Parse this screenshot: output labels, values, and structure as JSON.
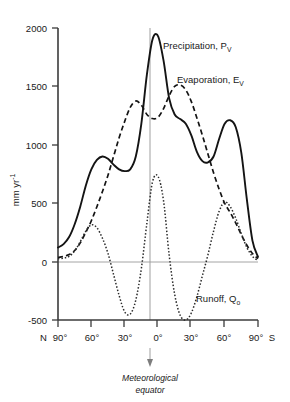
{
  "chart_data": {
    "type": "line",
    "title": "",
    "xlabel": "",
    "ylabel": "mm yr",
    "ylabel_exponent": "-1",
    "ylim": [
      -500,
      2000
    ],
    "yticks": [
      -500,
      0,
      500,
      1000,
      1500,
      2000
    ],
    "ytick_labels": [
      "-500",
      "0",
      "500",
      "1000",
      "1500",
      "2000"
    ],
    "xlim": [
      -90,
      90
    ],
    "xticks": [
      -90,
      -60,
      -30,
      0,
      30,
      60,
      90
    ],
    "xtick_labels": [
      "90°",
      "60°",
      "30°",
      "0°",
      "30°",
      "60°",
      "90°"
    ],
    "x_axis_left_prefix": "N",
    "x_axis_right_suffix": "S",
    "grid": false,
    "zero_line": true,
    "legend_position": "inline-annotations",
    "annotations": [
      {
        "name": "meteorological-equator",
        "line1": "Meteorological",
        "line2": "equator",
        "x_value": -5
      }
    ],
    "series": [
      {
        "name": "Precipitation, P",
        "subscript": "V",
        "style": "solid",
        "x": [
          -90,
          -85,
          -80,
          -75,
          -70,
          -65,
          -60,
          -55,
          -50,
          -45,
          -40,
          -35,
          -30,
          -25,
          -20,
          -15,
          -10,
          -5,
          0,
          5,
          10,
          15,
          20,
          25,
          30,
          35,
          40,
          45,
          50,
          55,
          60,
          65,
          70,
          75,
          80,
          85,
          90
        ],
        "values": [
          120,
          150,
          210,
          320,
          470,
          650,
          790,
          870,
          900,
          880,
          830,
          790,
          775,
          790,
          900,
          1180,
          1600,
          1900,
          1930,
          1720,
          1400,
          1260,
          1220,
          1180,
          1080,
          940,
          860,
          850,
          900,
          1050,
          1180,
          1210,
          1150,
          930,
          530,
          180,
          40
        ]
      },
      {
        "name": "Evaporation, E",
        "subscript": "V",
        "style": "dashed",
        "x": [
          -90,
          -85,
          -80,
          -75,
          -70,
          -65,
          -60,
          -55,
          -50,
          -45,
          -40,
          -35,
          -30,
          -25,
          -20,
          -15,
          -10,
          -5,
          0,
          5,
          10,
          15,
          20,
          25,
          30,
          35,
          40,
          45,
          50,
          55,
          60,
          65,
          70,
          75,
          80,
          85,
          90
        ],
        "values": [
          35,
          45,
          60,
          95,
          160,
          250,
          350,
          470,
          600,
          740,
          900,
          1060,
          1200,
          1320,
          1375,
          1340,
          1260,
          1225,
          1235,
          1310,
          1420,
          1500,
          1512,
          1470,
          1370,
          1230,
          1080,
          920,
          760,
          620,
          500,
          420,
          330,
          230,
          140,
          70,
          25
        ]
      },
      {
        "name": "Runoff, Q",
        "subscript": "o",
        "style": "dotted",
        "x": [
          -90,
          -85,
          -80,
          -75,
          -70,
          -65,
          -60,
          -55,
          -50,
          -45,
          -40,
          -35,
          -30,
          -25,
          -20,
          -15,
          -10,
          -5,
          0,
          5,
          10,
          15,
          20,
          25,
          30,
          35,
          40,
          45,
          50,
          55,
          60,
          65,
          70,
          75,
          80,
          85,
          90
        ],
        "values": [
          25,
          30,
          45,
          90,
          170,
          260,
          315,
          290,
          200,
          70,
          -110,
          -290,
          -430,
          -450,
          -330,
          -60,
          330,
          680,
          730,
          520,
          60,
          -280,
          -460,
          -500,
          -440,
          -300,
          -120,
          60,
          260,
          430,
          510,
          470,
          370,
          240,
          120,
          45,
          10
        ]
      }
    ]
  },
  "y_axis": {
    "label_main": "mm yr",
    "label_exponent": "-1"
  },
  "x_axis": {
    "left_cap": "N",
    "right_cap": "S",
    "labels": [
      "90°",
      "60°",
      "30°",
      "0°",
      "30°",
      "60°",
      "90°"
    ]
  },
  "labels": {
    "precipitation": "Precipitation, P",
    "precipitation_sub": "V",
    "evaporation": "Evaporation, E",
    "evaporation_sub": "V",
    "runoff": "Runoff, Q",
    "runoff_sub": "o",
    "equator_line1": "Meteorological",
    "equator_line2": "equator"
  },
  "colors": {
    "background": "#ffffff",
    "axis": "#3b3b3b",
    "curve": "#141414",
    "zero_line": "#9a9a9a",
    "equator_line": "#a8a8a8"
  }
}
